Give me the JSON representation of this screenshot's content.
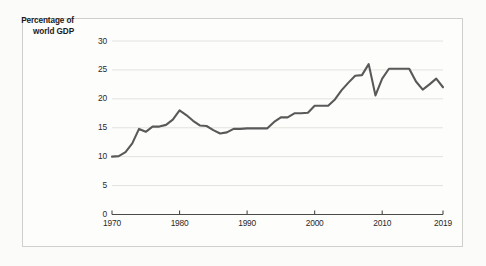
{
  "figure": {
    "axis_title_line1": "Percentage of",
    "axis_title_line2": "world GDP",
    "background": "#fbfbfa",
    "line_color": "#59595a",
    "grid_color": "#e2e2de",
    "axis_color": "#4a4a4a"
  },
  "chart_data": {
    "type": "line",
    "title": "",
    "subtitle": "",
    "xlabel": "",
    "ylabel": "Percentage of world GDP",
    "xlim": [
      1970,
      2019
    ],
    "ylim": [
      0,
      30
    ],
    "ytick_labels": [
      "0",
      "5",
      "10",
      "15",
      "20",
      "25",
      "30"
    ],
    "ytick_values": [
      0,
      5,
      10,
      15,
      20,
      25,
      30
    ],
    "xtick_labels": [
      "1970",
      "1980",
      "1990",
      "2000",
      "2010",
      "2019"
    ],
    "xtick_values": [
      1970,
      1980,
      1990,
      2000,
      2010,
      2019
    ],
    "grid": "horizontal",
    "legend": "none",
    "series": [
      {
        "name": "Percentage of world GDP",
        "x": [
          1970,
          1971,
          1972,
          1973,
          1974,
          1975,
          1976,
          1977,
          1978,
          1979,
          1980,
          1981,
          1982,
          1983,
          1984,
          1985,
          1986,
          1987,
          1988,
          1989,
          1990,
          1991,
          1992,
          1993,
          1994,
          1995,
          1996,
          1997,
          1998,
          1999,
          2000,
          2001,
          2002,
          2003,
          2004,
          2005,
          2006,
          2007,
          2008,
          2009,
          2010,
          2011,
          2012,
          2013,
          2014,
          2015,
          2016,
          2017,
          2018,
          2019
        ],
        "values": [
          10.0,
          10.1,
          10.8,
          12.3,
          14.8,
          14.3,
          15.2,
          15.2,
          15.5,
          16.4,
          18.0,
          17.2,
          16.2,
          15.4,
          15.3,
          14.6,
          14.0,
          14.2,
          14.8,
          14.8,
          14.9,
          14.9,
          14.9,
          14.9,
          16.0,
          16.8,
          16.8,
          17.5,
          17.5,
          17.6,
          18.8,
          18.8,
          18.8,
          19.9,
          21.5,
          22.8,
          24.0,
          24.1,
          26.0,
          20.6,
          23.5,
          25.2,
          25.2,
          25.2,
          25.2,
          23.0,
          21.6,
          22.5,
          23.5,
          22.0
        ]
      }
    ]
  }
}
